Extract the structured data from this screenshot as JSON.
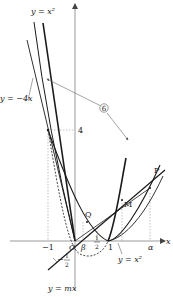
{
  "diagram": {
    "type": "function-graph",
    "axes": {
      "x_label": "x",
      "y_label": "y",
      "origin_label": "O"
    },
    "x_ticks": [
      {
        "label": "−1",
        "value": -1
      },
      {
        "label": "β",
        "value": 0.3
      },
      {
        "label": "1",
        "value": 0.5,
        "sub": "2"
      },
      {
        "label": "1",
        "value": 1
      },
      {
        "label": "α",
        "value": 2.6
      }
    ],
    "y_ticks": [
      {
        "label": "4",
        "value": 4
      },
      {
        "label": "−",
        "value": -0.5
      }
    ],
    "curve_labels": {
      "top_parabola": "y = x²",
      "left_line": "y = −4x",
      "bottom_line": "y = mx",
      "right_parabola": "y = x²",
      "half_label_top": "1",
      "half_label_bottom": "2",
      "minus_half_top": "1",
      "minus_half_bottom": "2",
      "minus_sign": "−"
    },
    "points": {
      "P": "P",
      "M": "M",
      "Q": "Q"
    },
    "marker": {
      "label": "⑥",
      "text": "6"
    },
    "colors": {
      "curve": "#1a1a1a",
      "axis": "#9a9a9a",
      "guide": "#999999",
      "dashed": "#333333"
    }
  }
}
